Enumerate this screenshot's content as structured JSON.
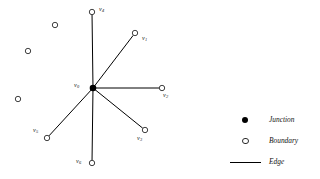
{
  "figure": {
    "type": "graph-diagram",
    "background_color": "#ffffff",
    "edge_color": "#000000",
    "junction_color": "#000000",
    "boundary_fill": "#ffffff",
    "boundary_stroke": "#2b2b2b",
    "junction": {
      "id": "v0",
      "label": "v",
      "subscript": "0",
      "x": 93,
      "y": 88,
      "label_x": 74,
      "label_y": 82
    },
    "boundary_vertices": [
      {
        "id": "v4",
        "label": "v",
        "subscript": "4",
        "x": 92,
        "y": 12,
        "label_x": 99,
        "label_y": 6,
        "connected": true
      },
      {
        "id": "v1",
        "label": "v",
        "subscript": "1",
        "x": 135,
        "y": 33,
        "label_x": 142,
        "label_y": 35,
        "connected": true
      },
      {
        "id": "v2",
        "label": "v",
        "subscript": "2",
        "x": 162,
        "y": 88,
        "label_x": 163,
        "label_y": 92,
        "connected": true
      },
      {
        "id": "v3",
        "label": "v",
        "subscript": "3",
        "x": 145,
        "y": 130,
        "label_x": 137,
        "label_y": 135,
        "connected": true
      },
      {
        "id": "v6",
        "label": "v",
        "subscript": "6",
        "x": 92,
        "y": 163,
        "label_x": 76,
        "label_y": 158,
        "connected": true
      },
      {
        "id": "v5",
        "label": "v",
        "subscript": "5",
        "x": 47,
        "y": 138,
        "label_x": 33,
        "label_y": 127,
        "connected": true
      }
    ],
    "isolated_vertices": [
      {
        "id": "iso1",
        "x": 55,
        "y": 25
      },
      {
        "id": "iso2",
        "x": 28,
        "y": 51
      },
      {
        "id": "iso3",
        "x": 18,
        "y": 99
      }
    ],
    "edges": [
      {
        "from": "v0",
        "to": "v4"
      },
      {
        "from": "v0",
        "to": "v1"
      },
      {
        "from": "v0",
        "to": "v2"
      },
      {
        "from": "v0",
        "to": "v3"
      },
      {
        "from": "v0",
        "to": "v6"
      },
      {
        "from": "v0",
        "to": "v5"
      }
    ]
  },
  "legend": {
    "items": [
      {
        "symbol": "filled-dot",
        "label": "Junction"
      },
      {
        "symbol": "open-circle",
        "label": "Boundary"
      },
      {
        "symbol": "line-segment",
        "label": "Edge"
      }
    ]
  }
}
